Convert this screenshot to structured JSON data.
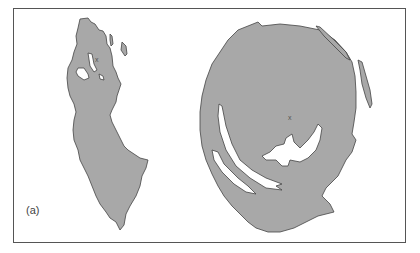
{
  "figure": {
    "panel_label": "(a)",
    "markers": [
      "x",
      "x"
    ],
    "colors": {
      "fill": "#a8a8a8",
      "outline": "#444444",
      "background": "#ffffff",
      "frame": "#555555"
    }
  }
}
